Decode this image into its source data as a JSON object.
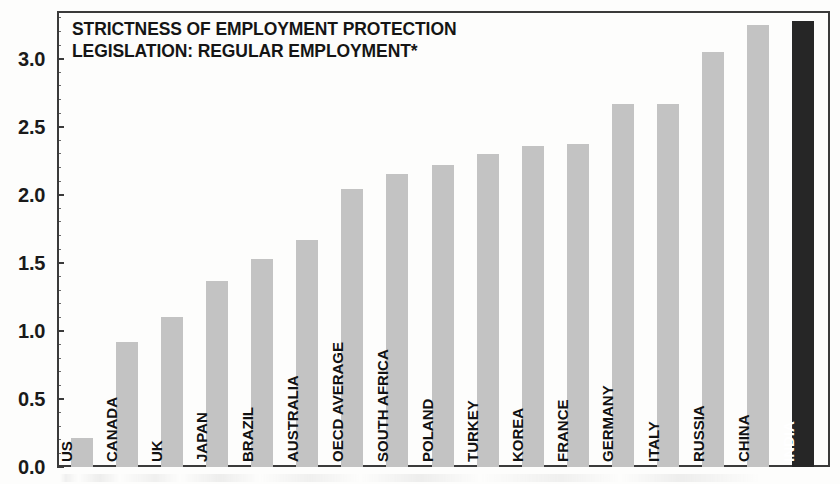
{
  "chart_data": {
    "type": "bar",
    "title": "STRICTNESS OF EMPLOYMENT PROTECTION LEGISLATION: REGULAR EMPLOYMENT*",
    "title_lines": [
      "STRICTNESS OF EMPLOYMENT PROTECTION",
      "LEGISLATION: REGULAR EMPLOYMENT*"
    ],
    "xlabel": "",
    "ylabel": "",
    "ylim": [
      0.0,
      3.35
    ],
    "grid": false,
    "legend": null,
    "ytick_labels": [
      "0.0",
      "0.5",
      "1.0",
      "1.5",
      "2.0",
      "2.5",
      "3.0"
    ],
    "ytick_values": [
      0.0,
      0.5,
      1.0,
      1.5,
      2.0,
      2.5,
      3.0
    ],
    "categories": [
      "US",
      "CANADA",
      "UK",
      "JAPAN",
      "BRAZIL",
      "AUSTRALIA",
      "OECD AVERAGE",
      "SOUTH AFRICA",
      "POLAND",
      "TURKEY",
      "KOREA",
      "FRANCE",
      "GERMANY",
      "ITALY",
      "RUSSIA",
      "CHINA",
      "INDIA"
    ],
    "values": [
      0.21,
      0.92,
      1.1,
      1.37,
      1.53,
      1.67,
      2.04,
      2.15,
      2.22,
      2.3,
      2.36,
      2.37,
      2.67,
      2.67,
      3.05,
      3.25,
      3.28
    ],
    "highlight_category": "INDIA",
    "colors": {
      "bar": "#c3c3c3",
      "bar_highlight": "#262626",
      "axis": "#3a3a3a",
      "text": "#121212",
      "background": "#fdfdfc"
    }
  }
}
